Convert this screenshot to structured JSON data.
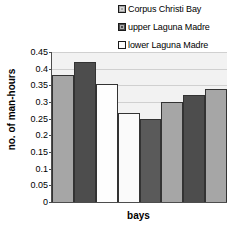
{
  "chart_data": {
    "type": "bar",
    "title": "",
    "xlabel": "bays",
    "ylabel": "no. of man-hours",
    "ylim": [
      0,
      0.45
    ],
    "ytick_labels": [
      "0.45",
      "0.4",
      "0.35",
      "0.3",
      "0.25",
      "0.2",
      "0.15",
      "0.1",
      "0.05",
      "0"
    ],
    "ytick_values": [
      0.45,
      0.4,
      0.35,
      0.3,
      0.25,
      0.2,
      0.15,
      0.1,
      0.05,
      0
    ],
    "grid": true,
    "legend_position": "top-right",
    "legend": [
      {
        "label": "Corpus Christi Bay",
        "color": "#a6a6a6"
      },
      {
        "label": "upper Laguna Madre",
        "color": "#4d4d4d"
      },
      {
        "label": "lower Laguna Madre",
        "color": "#fafafa"
      }
    ],
    "categories": [
      "1",
      "2",
      "3",
      "4",
      "5",
      "6",
      "7",
      "8"
    ],
    "values": [
      0.38,
      0.42,
      0.355,
      0.267,
      0.248,
      0.3,
      0.32,
      0.34
    ],
    "bar_colors": [
      "#a6a6a6",
      "#4d4d4d",
      "#fefefe",
      "#fafafa",
      "#5a5a5a",
      "#a6a6a6",
      "#4d4d4d",
      "#a6a6a6"
    ],
    "bar_series": [
      "Corpus Christi Bay",
      "upper Laguna Madre",
      "lower Laguna Madre",
      "lower Laguna Madre",
      "upper Laguna Madre",
      "Corpus Christi Bay",
      "upper Laguna Madre",
      "Corpus Christi Bay"
    ]
  }
}
